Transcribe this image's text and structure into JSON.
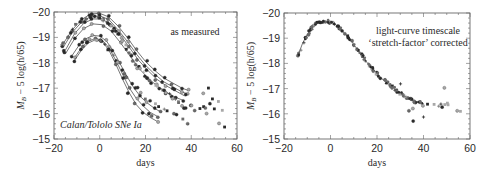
{
  "chart_data": [
    {
      "type": "scatter",
      "title": "",
      "annotation": "as measured",
      "annotation_corner": "Calan/Tololo SNe Ia",
      "xlabel": "days",
      "ylabel": "M_B − 5 log(h/65)",
      "xlim": [
        -20,
        60
      ],
      "ylim": [
        -15,
        -20
      ],
      "y_inverted": true,
      "xticks": [
        -20,
        0,
        20,
        40,
        60
      ],
      "yticks": [
        -20,
        -19,
        -18,
        -17,
        -16,
        -15
      ],
      "grid": false,
      "template_curves": [
        {
          "name": "bright-broad",
          "peak_mag": -19.95,
          "x": [
            -16,
            -12,
            -8,
            -4,
            0,
            4,
            8,
            12,
            16,
            20,
            24,
            28,
            32,
            36,
            39
          ],
          "y": [
            -18.75,
            -19.3,
            -19.7,
            -19.92,
            -19.95,
            -19.8,
            -19.45,
            -19.0,
            -18.5,
            -18.05,
            -17.7,
            -17.4,
            -17.2,
            -17.0,
            -16.9
          ]
        },
        {
          "name": "curve-2",
          "peak_mag": -19.85,
          "x": [
            -16,
            -12,
            -8,
            -4,
            0,
            4,
            8,
            12,
            16,
            20,
            24,
            28,
            32,
            36,
            39
          ],
          "y": [
            -18.6,
            -19.2,
            -19.6,
            -19.82,
            -19.85,
            -19.7,
            -19.3,
            -18.85,
            -18.35,
            -17.9,
            -17.55,
            -17.25,
            -17.05,
            -16.85,
            -16.75
          ]
        },
        {
          "name": "curve-3",
          "peak_mag": -19.75,
          "x": [
            -15,
            -11,
            -7,
            -3,
            1,
            5,
            9,
            13,
            17,
            21,
            25,
            29,
            33,
            37
          ],
          "y": [
            -18.5,
            -19.15,
            -19.55,
            -19.73,
            -19.72,
            -19.5,
            -19.1,
            -18.6,
            -18.1,
            -17.7,
            -17.35,
            -17.1,
            -16.9,
            -16.7
          ]
        },
        {
          "name": "curve-4",
          "peak_mag": -19.55,
          "x": [
            -15,
            -11,
            -7,
            -3,
            1,
            5,
            9,
            13,
            17,
            21,
            25,
            29,
            33,
            37
          ],
          "y": [
            -18.35,
            -18.95,
            -19.35,
            -19.53,
            -19.5,
            -19.25,
            -18.8,
            -18.3,
            -17.8,
            -17.4,
            -17.1,
            -16.85,
            -16.65,
            -16.5
          ]
        },
        {
          "name": "curve-5",
          "peak_mag": -19.1,
          "x": [
            -12,
            -9,
            -6,
            -3,
            0,
            3,
            6,
            9,
            12,
            15,
            18,
            21,
            24,
            27
          ],
          "y": [
            -18.3,
            -18.7,
            -18.95,
            -19.08,
            -19.05,
            -18.85,
            -18.45,
            -17.95,
            -17.45,
            -17.0,
            -16.65,
            -16.4,
            -16.2,
            -16.05
          ]
        },
        {
          "name": "curve-6",
          "peak_mag": -18.95,
          "x": [
            -11,
            -8,
            -5,
            -2,
            1,
            4,
            7,
            10,
            13,
            16,
            19,
            22,
            25
          ],
          "y": [
            -18.2,
            -18.6,
            -18.85,
            -18.95,
            -18.9,
            -18.6,
            -18.1,
            -17.55,
            -17.0,
            -16.6,
            -16.3,
            -16.05,
            -15.9
          ]
        },
        {
          "name": "dim-narrow",
          "peak_mag": -18.9,
          "x": [
            -11,
            -8,
            -5,
            -2,
            1,
            4,
            7,
            10,
            13,
            16,
            19,
            22,
            25
          ],
          "y": [
            -18.1,
            -18.5,
            -18.78,
            -18.9,
            -18.85,
            -18.5,
            -17.95,
            -17.35,
            -16.8,
            -16.35,
            -16.05,
            -15.85,
            -15.7
          ]
        }
      ],
      "points": {
        "x": [
          -16,
          -14,
          -12,
          -10,
          -8,
          -6,
          -4,
          -3,
          -2,
          -1,
          0,
          1,
          2,
          3,
          4,
          5,
          6,
          7,
          8,
          9,
          10,
          11,
          12,
          13,
          14,
          15,
          16,
          17,
          18,
          19,
          20,
          21,
          22,
          23,
          24,
          25,
          26,
          27,
          28,
          29,
          30,
          31,
          32,
          33,
          34,
          35,
          36,
          37,
          38,
          40,
          42,
          44,
          45,
          46,
          47,
          48,
          49,
          50,
          52,
          53,
          54,
          -8,
          -6,
          -4,
          -2,
          0,
          2,
          4,
          6,
          8,
          10,
          12,
          14,
          16,
          18,
          20,
          22,
          24,
          26,
          28,
          30,
          32,
          34,
          36,
          38,
          40,
          45,
          47,
          52
        ],
        "y": [
          -18.7,
          -19.0,
          -19.3,
          -19.5,
          -19.6,
          -19.75,
          -19.85,
          -19.9,
          -19.85,
          -19.8,
          -19.75,
          -19.7,
          -19.65,
          -19.6,
          -19.55,
          -19.45,
          -19.35,
          -19.25,
          -19.15,
          -19.0,
          -18.85,
          -18.7,
          -18.55,
          -18.4,
          -18.25,
          -18.1,
          -17.95,
          -17.85,
          -17.75,
          -17.6,
          -17.5,
          -17.4,
          -17.3,
          -17.2,
          -17.1,
          -17.05,
          -17.0,
          -16.95,
          -16.9,
          -16.8,
          -16.75,
          -16.7,
          -16.6,
          -16.55,
          -16.5,
          -16.45,
          -16.3,
          -16.2,
          -16.2,
          -16.3,
          -16.1,
          -16.2,
          -16.3,
          -16.2,
          -16.0,
          -16.4,
          -16.6,
          -16.2,
          -16.5,
          -16.1,
          -15.5,
          -18.8,
          -18.9,
          -18.95,
          -18.9,
          -18.85,
          -18.7,
          -18.5,
          -18.3,
          -18.0,
          -17.7,
          -17.45,
          -17.2,
          -17.0,
          -16.8,
          -16.6,
          -16.5,
          -16.4,
          -16.3,
          -16.2,
          -16.1,
          -16.0,
          -15.95,
          -15.8,
          -15.6,
          -16.3,
          -16.8,
          -17.0,
          -15.6
        ]
      }
    },
    {
      "type": "scatter",
      "title": "",
      "annotation": [
        "light-curve timescale",
        "‘stretch-factor’ corrected"
      ],
      "xlabel": "days",
      "ylabel": "M_B − 5 log(h/65)",
      "xlim": [
        -20,
        60
      ],
      "ylim": [
        -15,
        -20
      ],
      "y_inverted": true,
      "xticks": [
        -20,
        0,
        20,
        40,
        60
      ],
      "yticks": [
        -20,
        -19,
        -18,
        -17,
        -16,
        -15
      ],
      "grid": false,
      "template_curve": {
        "x": [
          -14,
          -12,
          -10,
          -8,
          -6,
          -4,
          -2,
          0,
          2,
          4,
          6,
          8,
          10,
          12,
          14,
          16,
          18,
          20,
          22,
          24,
          26,
          28,
          30,
          32,
          34,
          36,
          38,
          40
        ],
        "y": [
          -18.3,
          -18.8,
          -19.15,
          -19.4,
          -19.58,
          -19.65,
          -19.67,
          -19.65,
          -19.55,
          -19.4,
          -19.2,
          -19.0,
          -18.75,
          -18.5,
          -18.25,
          -18.0,
          -17.8,
          -17.6,
          -17.4,
          -17.25,
          -17.1,
          -16.95,
          -16.8,
          -16.7,
          -16.6,
          -16.5,
          -16.45,
          -16.4
        ]
      },
      "points": {
        "x": [
          -14,
          -13,
          -12,
          -11,
          -10,
          -9,
          -8,
          -7,
          -6,
          -5,
          -4,
          -3,
          -2,
          -1,
          0,
          1,
          2,
          3,
          4,
          5,
          6,
          7,
          8,
          9,
          10,
          11,
          12,
          13,
          14,
          15,
          16,
          17,
          18,
          19,
          20,
          21,
          22,
          23,
          24,
          25,
          26,
          27,
          28,
          29,
          30,
          31,
          32,
          33,
          34,
          35,
          36,
          37,
          38,
          40,
          42,
          44,
          46,
          47,
          48,
          49,
          50,
          51,
          54,
          56,
          40,
          49,
          30,
          34,
          36,
          35
        ],
        "y": [
          -18.3,
          -18.55,
          -18.8,
          -19.0,
          -19.15,
          -19.3,
          -19.4,
          -19.5,
          -19.58,
          -19.62,
          -19.65,
          -19.66,
          -19.67,
          -19.66,
          -19.65,
          -19.6,
          -19.55,
          -19.5,
          -19.4,
          -19.3,
          -19.2,
          -19.1,
          -19.0,
          -18.9,
          -18.75,
          -18.6,
          -18.5,
          -18.38,
          -18.25,
          -18.12,
          -18.0,
          -17.9,
          -17.8,
          -17.7,
          -17.6,
          -17.5,
          -17.4,
          -17.32,
          -17.25,
          -17.18,
          -17.1,
          -17.02,
          -16.95,
          -16.88,
          -16.8,
          -16.75,
          -16.7,
          -16.65,
          -16.6,
          -16.55,
          -16.5,
          -16.45,
          -16.45,
          -16.3,
          -16.4,
          -16.35,
          -16.3,
          -16.4,
          -16.25,
          -16.35,
          -16.4,
          -16.35,
          -16.1,
          -16.1,
          -15.85,
          -17.0,
          -17.2,
          -16.1,
          -16.2,
          -15.7
        ]
      }
    }
  ],
  "panels": [
    {
      "frame": {
        "left": 54,
        "top": 12,
        "right": 237,
        "bottom": 139
      },
      "annotation_lines": [
        "as measured"
      ],
      "annotation_pos": {
        "x": 195,
        "y": 35
      },
      "corner_label": "Calan/Tololo SNe Ia",
      "corner_pos": {
        "x": 60,
        "y": 128
      }
    },
    {
      "frame": {
        "left": 284,
        "top": 13,
        "right": 470,
        "bottom": 139
      },
      "annotation_lines": [
        "light-curve timescale",
        "‘stretch-factor’ corrected"
      ],
      "annotation_pos": {
        "x": 418,
        "y": 34
      },
      "corner_label": "",
      "corner_pos": {
        "x": 0,
        "y": 0
      }
    }
  ],
  "labels": {
    "xlabel": "days",
    "ylabel_main": "M",
    "ylabel_sub": "B",
    "ylabel_rest": " − 5 log(h/65)"
  },
  "colors": {
    "frame": "#555555",
    "curve": "#3a3a3a",
    "dark_point": "#2a2a2a",
    "mid_point": "#6a6a6a",
    "light_point": "#a8a8a8"
  }
}
